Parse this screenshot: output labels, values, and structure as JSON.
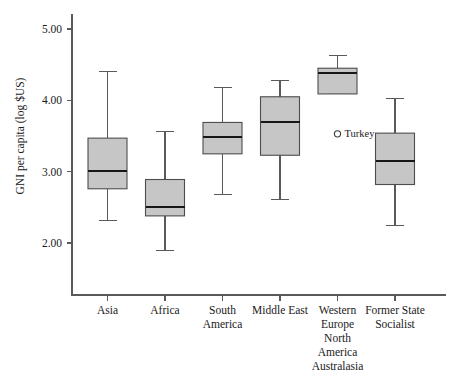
{
  "chart_data": {
    "type": "box",
    "title": "",
    "xlabel": "",
    "ylabel": "GNI per capita (log $US)",
    "ylim": [
      1.55,
      5.25
    ],
    "yticks": [
      2.0,
      3.0,
      4.0,
      5.0
    ],
    "ytick_labels": [
      "2.00",
      "3.00",
      "4.00",
      "5.00"
    ],
    "grid": false,
    "legend": "none",
    "categories": [
      "Asia",
      "Africa",
      "South America",
      "Middle East",
      "Western Europe North America Australasia",
      "Former State Socialist"
    ],
    "category_label_lines": [
      [
        "Asia"
      ],
      [
        "Africa"
      ],
      [
        "South",
        "America"
      ],
      [
        "Middle East"
      ],
      [
        "Western",
        "Europe",
        "North",
        "America",
        "Australasia"
      ],
      [
        "Former State",
        "Socialist"
      ]
    ],
    "boxes": [
      {
        "category": "Asia",
        "whisker_low": 2.31,
        "q1": 2.76,
        "median": 3.01,
        "q3": 3.47,
        "whisker_high": 4.4,
        "outliers": []
      },
      {
        "category": "Africa",
        "whisker_low": 1.9,
        "q1": 2.38,
        "median": 2.51,
        "q3": 2.89,
        "whisker_high": 3.56,
        "outliers": []
      },
      {
        "category": "South America",
        "whisker_low": 2.68,
        "q1": 3.25,
        "median": 3.49,
        "q3": 3.69,
        "whisker_high": 4.18,
        "outliers": []
      },
      {
        "category": "Middle East",
        "whisker_low": 2.61,
        "q1": 3.23,
        "median": 3.7,
        "q3": 4.05,
        "whisker_high": 4.28,
        "outliers": []
      },
      {
        "category": "Western Europe North America Australasia",
        "whisker_low": 4.09,
        "q1": 4.09,
        "median": 4.38,
        "q3": 4.45,
        "whisker_high": 4.63,
        "outliers": [
          {
            "label": "Turkey",
            "value": 3.53
          }
        ]
      },
      {
        "category": "Former State Socialist",
        "whisker_low": 2.25,
        "q1": 2.82,
        "median": 3.15,
        "q3": 3.54,
        "whisker_high": 4.02,
        "outliers": []
      }
    ],
    "colors": {
      "box_fill": "#c6c6c6",
      "box_stroke": "#4d4d4d",
      "median": "#171717",
      "whisker": "#595959",
      "axis": "#5a5a5a",
      "text": "#1a1a1a"
    }
  }
}
